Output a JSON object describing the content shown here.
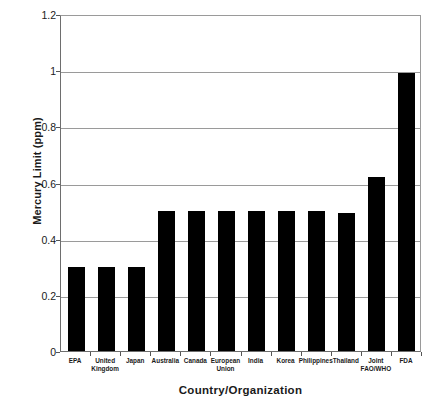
{
  "chart_data": {
    "type": "bar",
    "title": "",
    "xlabel": "Country/Organization",
    "ylabel": "Mercury Limit (ppm)",
    "categories": [
      "EPA",
      "United Kingdom",
      "Japan",
      "Australia",
      "Canada",
      "European Union",
      "India",
      "Korea",
      "Philippines",
      "Thailand",
      "Joint FAO/WHO",
      "FDA"
    ],
    "category_label_lines": [
      [
        "EPA"
      ],
      [
        "United",
        "Kingdom"
      ],
      [
        "Japan"
      ],
      [
        "Australia"
      ],
      [
        "Canada"
      ],
      [
        "European",
        "Union"
      ],
      [
        "India"
      ],
      [
        "Korea"
      ],
      [
        "Philippines"
      ],
      [
        "Thailand"
      ],
      [
        "Joint",
        "FAO/WHO"
      ],
      [
        "FDA"
      ]
    ],
    "values": [
      0.3,
      0.3,
      0.3,
      0.5,
      0.5,
      0.5,
      0.5,
      0.5,
      0.5,
      0.49,
      0.62,
      0.99
    ],
    "ylim": [
      0,
      1.2
    ],
    "yticks": [
      0,
      0.2,
      0.4,
      0.6,
      0.8,
      1,
      1.2
    ],
    "ytick_labels": [
      "0",
      "0.2",
      "0.4",
      "0.6",
      "0.8",
      "1",
      "1.2"
    ],
    "grid": true,
    "legend": false,
    "bar_color": "#000000",
    "gridline_color": "#9a9a9a",
    "axis_color": "#6e6e6e",
    "background": "#ffffff"
  }
}
